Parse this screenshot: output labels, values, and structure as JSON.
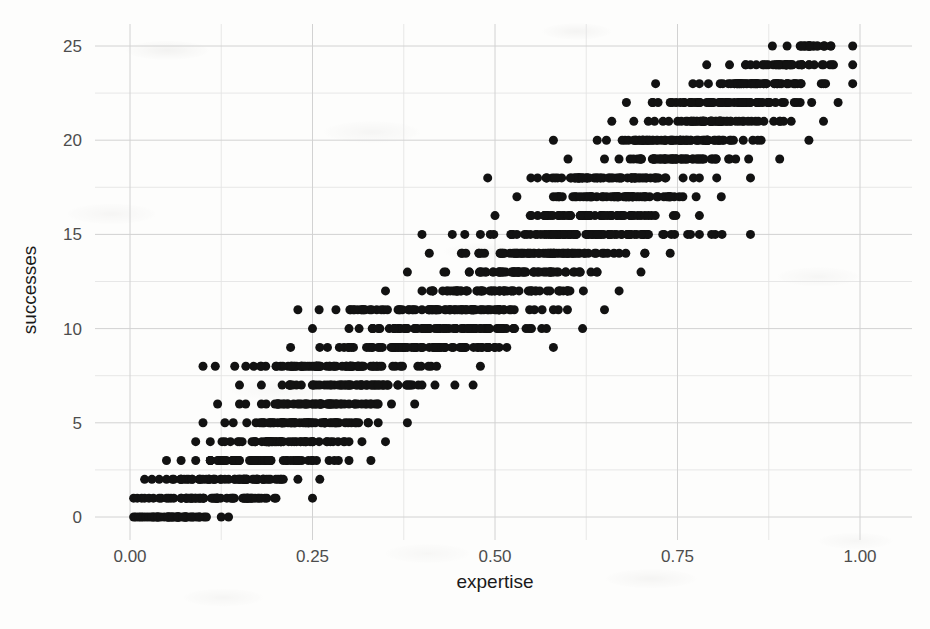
{
  "figure": {
    "background_color": "#fdfdfc",
    "point_color": "#121212",
    "grid_major_color": "#d2d2d2",
    "grid_minor_color": "#e4e4e4",
    "tick_label_color": "#4d4d4d",
    "axis_title_color": "#1a1a1a"
  },
  "chart_data": {
    "type": "scatter",
    "title": "",
    "subtitle": "",
    "xlabel": "expertise",
    "ylabel": "successes",
    "xlim": [
      -0.03,
      1.03
    ],
    "ylim": [
      -1.0,
      26.0
    ],
    "xticks": [
      0.0,
      0.25,
      0.5,
      0.75,
      1.0
    ],
    "xtick_labels": [
      "0.00",
      "0.25",
      "0.50",
      "0.75",
      "1.00"
    ],
    "yticks": [
      0,
      5,
      10,
      15,
      20,
      25
    ],
    "ytick_labels": [
      "0",
      "5",
      "10",
      "15",
      "20",
      "25"
    ],
    "x_minor_ticks": [
      0.125,
      0.375,
      0.625,
      0.875
    ],
    "y_minor_ticks": [
      2.5,
      7.5,
      12.5,
      17.5,
      22.5
    ],
    "grid": true,
    "legend": null,
    "legend_position": "none",
    "point_size_px": 9,
    "n_points": 2000,
    "trials": 25,
    "relationship": "successes ~ Binomial(25, expertise)",
    "points": [
      {
        "x": 0.005,
        "y": 0
      },
      {
        "x": 0.008,
        "y": 0
      },
      {
        "x": 0.012,
        "y": 0
      },
      {
        "x": 0.015,
        "y": 0
      },
      {
        "x": 0.018,
        "y": 0
      },
      {
        "x": 0.022,
        "y": 0
      },
      {
        "x": 0.026,
        "y": 0
      },
      {
        "x": 0.03,
        "y": 0
      },
      {
        "x": 0.034,
        "y": 0
      },
      {
        "x": 0.038,
        "y": 0
      },
      {
        "x": 0.042,
        "y": 0
      },
      {
        "x": 0.047,
        "y": 0
      },
      {
        "x": 0.052,
        "y": 0
      },
      {
        "x": 0.058,
        "y": 0
      },
      {
        "x": 0.065,
        "y": 0
      },
      {
        "x": 0.072,
        "y": 0
      },
      {
        "x": 0.085,
        "y": 0
      },
      {
        "x": 0.095,
        "y": 0
      },
      {
        "x": 0.125,
        "y": 0
      },
      {
        "x": 0.135,
        "y": 0
      },
      {
        "x": 0.005,
        "y": 1
      },
      {
        "x": 0.01,
        "y": 1
      },
      {
        "x": 0.016,
        "y": 1
      },
      {
        "x": 0.02,
        "y": 1
      },
      {
        "x": 0.026,
        "y": 1
      },
      {
        "x": 0.032,
        "y": 1
      },
      {
        "x": 0.04,
        "y": 1
      },
      {
        "x": 0.05,
        "y": 1
      },
      {
        "x": 0.06,
        "y": 1
      },
      {
        "x": 0.07,
        "y": 1
      },
      {
        "x": 0.08,
        "y": 1
      },
      {
        "x": 0.09,
        "y": 1
      },
      {
        "x": 0.1,
        "y": 1
      },
      {
        "x": 0.12,
        "y": 1
      },
      {
        "x": 0.14,
        "y": 1
      },
      {
        "x": 0.16,
        "y": 1
      },
      {
        "x": 0.18,
        "y": 1
      },
      {
        "x": 0.2,
        "y": 1
      },
      {
        "x": 0.25,
        "y": 1
      },
      {
        "x": 0.02,
        "y": 2
      },
      {
        "x": 0.03,
        "y": 2
      },
      {
        "x": 0.04,
        "y": 2
      },
      {
        "x": 0.05,
        "y": 2
      },
      {
        "x": 0.06,
        "y": 2
      },
      {
        "x": 0.07,
        "y": 2
      },
      {
        "x": 0.085,
        "y": 2
      },
      {
        "x": 0.1,
        "y": 2
      },
      {
        "x": 0.115,
        "y": 2
      },
      {
        "x": 0.13,
        "y": 2
      },
      {
        "x": 0.15,
        "y": 2
      },
      {
        "x": 0.17,
        "y": 2
      },
      {
        "x": 0.19,
        "y": 2
      },
      {
        "x": 0.21,
        "y": 2
      },
      {
        "x": 0.23,
        "y": 2
      },
      {
        "x": 0.26,
        "y": 2
      },
      {
        "x": 0.05,
        "y": 3
      },
      {
        "x": 0.07,
        "y": 3
      },
      {
        "x": 0.09,
        "y": 3
      },
      {
        "x": 0.11,
        "y": 3
      },
      {
        "x": 0.13,
        "y": 3
      },
      {
        "x": 0.15,
        "y": 3
      },
      {
        "x": 0.17,
        "y": 3
      },
      {
        "x": 0.19,
        "y": 3
      },
      {
        "x": 0.21,
        "y": 3
      },
      {
        "x": 0.23,
        "y": 3
      },
      {
        "x": 0.25,
        "y": 3
      },
      {
        "x": 0.28,
        "y": 3
      },
      {
        "x": 0.3,
        "y": 3
      },
      {
        "x": 0.33,
        "y": 3
      },
      {
        "x": 0.09,
        "y": 4
      },
      {
        "x": 0.11,
        "y": 4
      },
      {
        "x": 0.13,
        "y": 4
      },
      {
        "x": 0.15,
        "y": 4
      },
      {
        "x": 0.17,
        "y": 4
      },
      {
        "x": 0.19,
        "y": 4
      },
      {
        "x": 0.21,
        "y": 4
      },
      {
        "x": 0.24,
        "y": 4
      },
      {
        "x": 0.27,
        "y": 4
      },
      {
        "x": 0.3,
        "y": 4
      },
      {
        "x": 0.35,
        "y": 4
      },
      {
        "x": 0.1,
        "y": 5
      },
      {
        "x": 0.13,
        "y": 5
      },
      {
        "x": 0.16,
        "y": 5
      },
      {
        "x": 0.19,
        "y": 5
      },
      {
        "x": 0.22,
        "y": 5
      },
      {
        "x": 0.25,
        "y": 5
      },
      {
        "x": 0.28,
        "y": 5
      },
      {
        "x": 0.31,
        "y": 5
      },
      {
        "x": 0.34,
        "y": 5
      },
      {
        "x": 0.38,
        "y": 5
      },
      {
        "x": 0.12,
        "y": 6
      },
      {
        "x": 0.15,
        "y": 6
      },
      {
        "x": 0.18,
        "y": 6
      },
      {
        "x": 0.21,
        "y": 6
      },
      {
        "x": 0.24,
        "y": 6
      },
      {
        "x": 0.27,
        "y": 6
      },
      {
        "x": 0.3,
        "y": 6
      },
      {
        "x": 0.34,
        "y": 6
      },
      {
        "x": 0.39,
        "y": 6
      },
      {
        "x": 0.15,
        "y": 7
      },
      {
        "x": 0.18,
        "y": 7
      },
      {
        "x": 0.22,
        "y": 7
      },
      {
        "x": 0.26,
        "y": 7
      },
      {
        "x": 0.3,
        "y": 7
      },
      {
        "x": 0.34,
        "y": 7
      },
      {
        "x": 0.4,
        "y": 7
      },
      {
        "x": 0.47,
        "y": 7
      },
      {
        "x": 0.1,
        "y": 8
      },
      {
        "x": 0.2,
        "y": 8
      },
      {
        "x": 0.24,
        "y": 8
      },
      {
        "x": 0.28,
        "y": 8
      },
      {
        "x": 0.32,
        "y": 8
      },
      {
        "x": 0.36,
        "y": 8
      },
      {
        "x": 0.42,
        "y": 8
      },
      {
        "x": 0.48,
        "y": 8
      },
      {
        "x": 0.22,
        "y": 9
      },
      {
        "x": 0.26,
        "y": 9
      },
      {
        "x": 0.3,
        "y": 9
      },
      {
        "x": 0.34,
        "y": 9
      },
      {
        "x": 0.38,
        "y": 9
      },
      {
        "x": 0.43,
        "y": 9
      },
      {
        "x": 0.5,
        "y": 9
      },
      {
        "x": 0.58,
        "y": 9
      },
      {
        "x": 0.25,
        "y": 10
      },
      {
        "x": 0.3,
        "y": 10
      },
      {
        "x": 0.34,
        "y": 10
      },
      {
        "x": 0.38,
        "y": 10
      },
      {
        "x": 0.43,
        "y": 10
      },
      {
        "x": 0.48,
        "y": 10
      },
      {
        "x": 0.55,
        "y": 10
      },
      {
        "x": 0.62,
        "y": 10
      },
      {
        "x": 0.23,
        "y": 11
      },
      {
        "x": 0.32,
        "y": 11
      },
      {
        "x": 0.37,
        "y": 11
      },
      {
        "x": 0.42,
        "y": 11
      },
      {
        "x": 0.47,
        "y": 11
      },
      {
        "x": 0.52,
        "y": 11
      },
      {
        "x": 0.58,
        "y": 11
      },
      {
        "x": 0.65,
        "y": 11
      },
      {
        "x": 0.35,
        "y": 12
      },
      {
        "x": 0.4,
        "y": 12
      },
      {
        "x": 0.45,
        "y": 12
      },
      {
        "x": 0.5,
        "y": 12
      },
      {
        "x": 0.55,
        "y": 12
      },
      {
        "x": 0.6,
        "y": 12
      },
      {
        "x": 0.67,
        "y": 12
      },
      {
        "x": 0.38,
        "y": 13
      },
      {
        "x": 0.43,
        "y": 13
      },
      {
        "x": 0.48,
        "y": 13
      },
      {
        "x": 0.53,
        "y": 13
      },
      {
        "x": 0.58,
        "y": 13
      },
      {
        "x": 0.64,
        "y": 13
      },
      {
        "x": 0.7,
        "y": 13
      },
      {
        "x": 0.41,
        "y": 14
      },
      {
        "x": 0.46,
        "y": 14
      },
      {
        "x": 0.51,
        "y": 14
      },
      {
        "x": 0.56,
        "y": 14
      },
      {
        "x": 0.61,
        "y": 14
      },
      {
        "x": 0.67,
        "y": 14
      },
      {
        "x": 0.74,
        "y": 14
      },
      {
        "x": 0.4,
        "y": 15
      },
      {
        "x": 0.48,
        "y": 15
      },
      {
        "x": 0.53,
        "y": 15
      },
      {
        "x": 0.58,
        "y": 15
      },
      {
        "x": 0.64,
        "y": 15
      },
      {
        "x": 0.7,
        "y": 15
      },
      {
        "x": 0.78,
        "y": 15
      },
      {
        "x": 0.85,
        "y": 15
      },
      {
        "x": 0.5,
        "y": 16
      },
      {
        "x": 0.55,
        "y": 16
      },
      {
        "x": 0.6,
        "y": 16
      },
      {
        "x": 0.65,
        "y": 16
      },
      {
        "x": 0.71,
        "y": 16
      },
      {
        "x": 0.78,
        "y": 16
      },
      {
        "x": 0.53,
        "y": 17
      },
      {
        "x": 0.58,
        "y": 17
      },
      {
        "x": 0.63,
        "y": 17
      },
      {
        "x": 0.68,
        "y": 17
      },
      {
        "x": 0.74,
        "y": 17
      },
      {
        "x": 0.81,
        "y": 17
      },
      {
        "x": 0.49,
        "y": 18
      },
      {
        "x": 0.57,
        "y": 18
      },
      {
        "x": 0.62,
        "y": 18
      },
      {
        "x": 0.67,
        "y": 18
      },
      {
        "x": 0.72,
        "y": 18
      },
      {
        "x": 0.78,
        "y": 18
      },
      {
        "x": 0.85,
        "y": 18
      },
      {
        "x": 0.6,
        "y": 19
      },
      {
        "x": 0.65,
        "y": 19
      },
      {
        "x": 0.7,
        "y": 19
      },
      {
        "x": 0.76,
        "y": 19
      },
      {
        "x": 0.82,
        "y": 19
      },
      {
        "x": 0.89,
        "y": 19
      },
      {
        "x": 0.58,
        "y": 20
      },
      {
        "x": 0.64,
        "y": 20
      },
      {
        "x": 0.69,
        "y": 20
      },
      {
        "x": 0.74,
        "y": 20
      },
      {
        "x": 0.8,
        "y": 20
      },
      {
        "x": 0.86,
        "y": 20
      },
      {
        "x": 0.93,
        "y": 20
      },
      {
        "x": 0.66,
        "y": 21
      },
      {
        "x": 0.71,
        "y": 21
      },
      {
        "x": 0.77,
        "y": 21
      },
      {
        "x": 0.83,
        "y": 21
      },
      {
        "x": 0.89,
        "y": 21
      },
      {
        "x": 0.95,
        "y": 21
      },
      {
        "x": 0.68,
        "y": 22
      },
      {
        "x": 0.74,
        "y": 22
      },
      {
        "x": 0.79,
        "y": 22
      },
      {
        "x": 0.85,
        "y": 22
      },
      {
        "x": 0.91,
        "y": 22
      },
      {
        "x": 0.97,
        "y": 22
      },
      {
        "x": 0.72,
        "y": 23
      },
      {
        "x": 0.78,
        "y": 23
      },
      {
        "x": 0.84,
        "y": 23
      },
      {
        "x": 0.9,
        "y": 23
      },
      {
        "x": 0.95,
        "y": 23
      },
      {
        "x": 0.99,
        "y": 23
      },
      {
        "x": 0.79,
        "y": 24
      },
      {
        "x": 0.85,
        "y": 24
      },
      {
        "x": 0.9,
        "y": 24
      },
      {
        "x": 0.95,
        "y": 24
      },
      {
        "x": 0.99,
        "y": 24
      },
      {
        "x": 0.88,
        "y": 25
      },
      {
        "x": 0.92,
        "y": 25
      },
      {
        "x": 0.96,
        "y": 25
      },
      {
        "x": 0.99,
        "y": 25
      }
    ]
  }
}
